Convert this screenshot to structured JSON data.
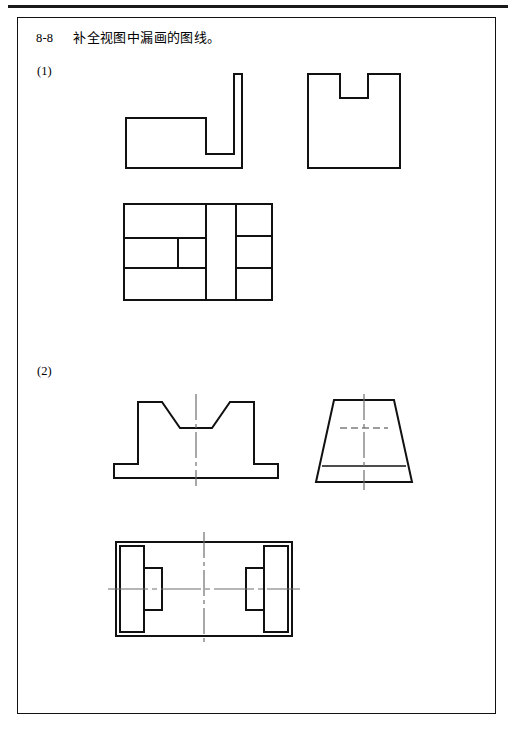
{
  "page": {
    "title_number": "8-8",
    "title_text": "补全视图中漏画的图线。",
    "border_color": "#111111",
    "line_color": "#111111",
    "hidden_line_color": "#7d7d7d",
    "center_line_color": "#6f6f6f",
    "background": "#ffffff"
  },
  "sections": [
    {
      "label": "(1)"
    },
    {
      "label": "(2)"
    }
  ],
  "figures": {
    "fig1_front_step": {
      "name": "L-shaped stepped front view",
      "viewbox": "0 0 132 110",
      "outline": "M 8,52 L 88,52 L 88,88 L 116,88 L 116,8 L 124,8 L 124,102 L 8,102 Z"
    },
    "fig2_u_notch": {
      "name": "U-shaped notched view",
      "viewbox": "0 0 112 110",
      "outline": "M 8,8 L 40,8 L 40,32 L 68,32 L 68,8 L 100,8 L 100,102 L 8,102 Z"
    },
    "fig3_top_grid": {
      "name": "Top view with internal partition lines",
      "viewbox": "0 0 160 112",
      "outline": "M 6,8 L 154,8 L 154,104 L 6,104 Z",
      "internal_lines": [
        "M 6,42 L 88,42",
        "M 6,72 L 88,72",
        "M 60,42 L 60,72",
        "M 88,8 L 88,104",
        "M 118,8 L 118,104",
        "M 118,40 L 154,40",
        "M 118,72 L 154,72"
      ]
    },
    "fig4_front_symmetric": {
      "name": "Symmetric stepped front view with chamfers",
      "viewbox": "0 0 166 104",
      "outline": "M 8,88 L 8,74 L 32,74 L 32,12 L 56,12 L 74,38 L 106,38 L 124,12 L 148,12 L 148,74 L 172,74 L 172,88 Z",
      "center_line": "M 90,4 L 90,96"
    },
    "fig5_trapezoid": {
      "name": "Trapezoid side view",
      "viewbox": "0 0 124 104",
      "outline": "M 34,10 L 94,10 L 112,92 L 16,92 Z",
      "hidden_line": "M 40,38 L 88,38",
      "solid_internal": "M 22,76 L 106,76",
      "center_line": "M 64,4 L 64,100"
    },
    "fig6_bottom": {
      "name": "Bottom view with symmetric slots",
      "viewbox": "0 0 196 120",
      "outline": "M 10,14 L 186,14 L 186,108 L 10,108 Z",
      "left_outer": "M 14,18 L 38,18 L 38,104 L 14,104 Z",
      "left_inner": "M 38,40 L 56,40 L 56,82 L 38,82",
      "right_outer": "M 182,18 L 158,18 L 158,104 L 182,104 Z",
      "right_inner": "M 158,40 L 140,40 L 140,82 L 158,82",
      "center_line_v": "M 98,4 L 98,118",
      "center_line_h": "M 2,61 L 194,61"
    }
  }
}
